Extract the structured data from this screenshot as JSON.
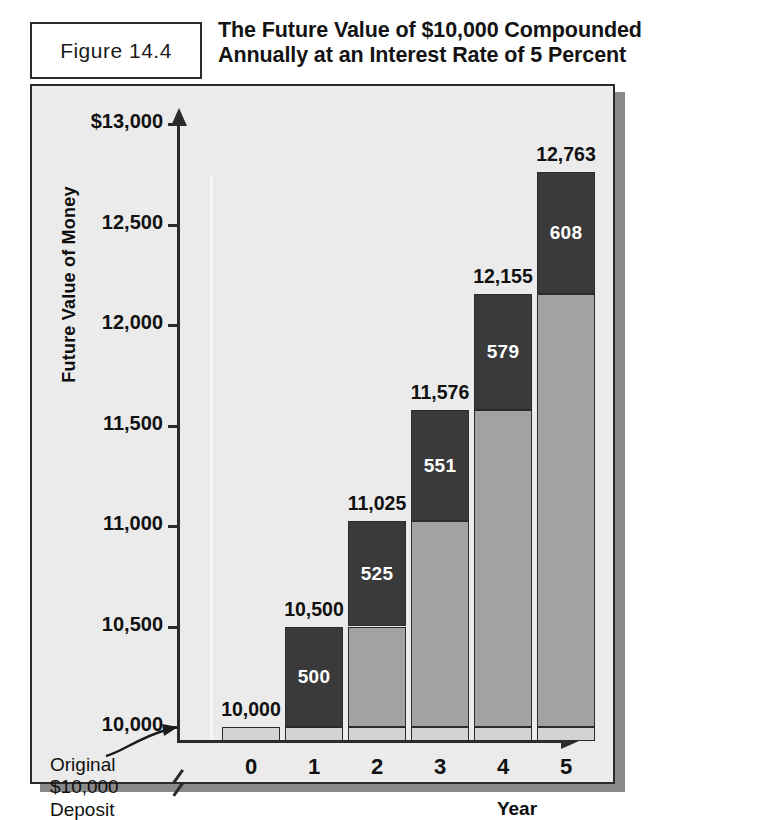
{
  "figure": {
    "label": "Figure 14.4",
    "title_line1": "The Future Value of $10,000 Compounded",
    "title_line2": "Annually at an Interest Rate of 5 Percent"
  },
  "annotation": {
    "line1": "Original",
    "line2": "$10,000",
    "line3": "Deposit"
  },
  "colors": {
    "principal": "#d3d3d3",
    "accumulated_interest": "#a2a2a2",
    "current_interest": "#3a3a3a",
    "panel_background": "#ebebeb",
    "axis": "#2b2b2b"
  },
  "chart_data": {
    "type": "bar",
    "subtype": "stacked",
    "title": "The Future Value of $10,000 Compounded Annually at an Interest Rate of 5 Percent",
    "xlabel": "Year",
    "ylabel": "Future Value of Money",
    "categories": [
      "0",
      "1",
      "2",
      "3",
      "4",
      "5"
    ],
    "ylim": [
      10000,
      13000
    ],
    "yticks": [
      10000,
      10500,
      11000,
      11500,
      12000,
      12500,
      13000
    ],
    "ytick_labels": [
      "10,000",
      "10,500",
      "11,000",
      "11,500",
      "12,000",
      "12,500",
      "$13,000"
    ],
    "axis_break_below": 10000,
    "grid": false,
    "legend": "none",
    "series": [
      {
        "name": "Original deposit (principal)",
        "color": "#d3d3d3",
        "values": [
          10000,
          10000,
          10000,
          10000,
          10000,
          10000
        ]
      },
      {
        "name": "Accumulated prior interest",
        "color": "#a2a2a2",
        "values": [
          0,
          0,
          500,
          1025,
          1576,
          2155
        ]
      },
      {
        "name": "Interest earned this year",
        "color": "#3a3a3a",
        "values": [
          0,
          500,
          525,
          551,
          579,
          608
        ]
      }
    ],
    "totals": [
      10000,
      10500,
      11025,
      11576,
      12155,
      12763
    ],
    "total_labels": [
      "10,000",
      "10,500",
      "11,025",
      "11,576",
      "12,155",
      "12,763"
    ],
    "interest_labels": [
      "",
      "500",
      "525",
      "551",
      "579",
      "608"
    ]
  }
}
